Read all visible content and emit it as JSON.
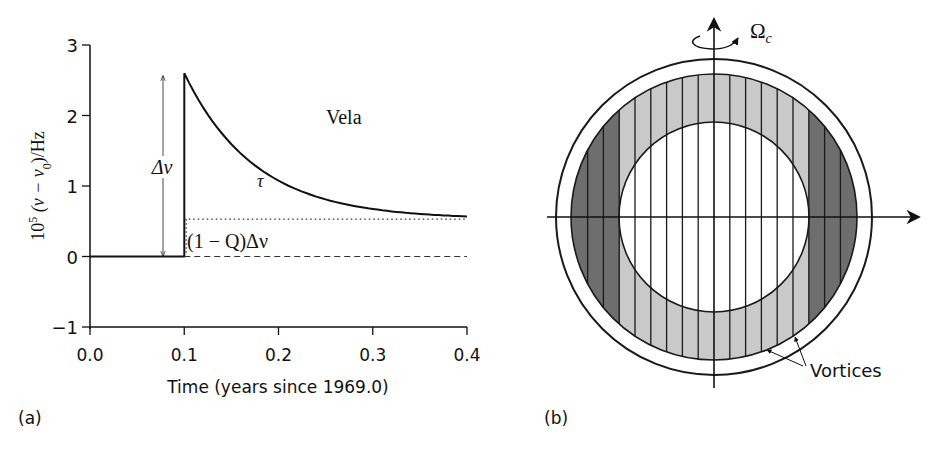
{
  "panel_a": {
    "label": "(a)",
    "annotation_vela": "Vela",
    "annotation_delta_nu": "Δν",
    "annotation_tau": "τ",
    "annotation_recovery": "(1 − Q)Δν"
  },
  "panel_b": {
    "label": "(b)",
    "omega_label": "Ω",
    "omega_subscript": "c",
    "vortices_label": "Vortices",
    "colors": {
      "dark_band": "#6e6e6e",
      "light_band": "#c9c9c9",
      "line": "#1a1a1a"
    }
  },
  "chart_data": [
    {
      "type": "line",
      "title": "Vela",
      "xlabel": "Time (years since 1969.0)",
      "ylabel": "10^5 (ν − ν₀)/Hz",
      "ylabel_parts": {
        "prefix": "10",
        "exp": "5",
        "body": " (ν − ν",
        "sub": "0",
        "suffix": ")/Hz"
      },
      "xlim": [
        0.0,
        0.4
      ],
      "ylim": [
        -1,
        3
      ],
      "xticks": [
        "0.0",
        "0.1",
        "0.2",
        "0.3",
        "0.4"
      ],
      "yticks": [
        "−1",
        "0",
        "1",
        "2",
        "3"
      ],
      "grid": false,
      "series": [
        {
          "name": "frequency residual (glitch + exponential recovery)",
          "style": "solid",
          "x": [
            0.0,
            0.1,
            0.1,
            0.12,
            0.14,
            0.16,
            0.18,
            0.2,
            0.22,
            0.25,
            0.28,
            0.31,
            0.34,
            0.37,
            0.4
          ],
          "y": [
            0.0,
            0.0,
            2.6,
            2.12,
            1.75,
            1.47,
            1.26,
            1.1,
            0.98,
            0.85,
            0.76,
            0.69,
            0.65,
            0.62,
            0.59
          ]
        },
        {
          "name": "permanent step level",
          "style": "dotted",
          "x": [
            0.1,
            0.4
          ],
          "y": [
            0.53,
            0.53
          ]
        },
        {
          "name": "pre-glitch baseline",
          "style": "dashed",
          "x": [
            0.1,
            0.4
          ],
          "y": [
            0.0,
            0.0
          ]
        }
      ],
      "annotations": [
        {
          "text": "Vela",
          "x": 0.26,
          "y": 2.0
        },
        {
          "text": "Δν",
          "x": 0.078,
          "y": 1.3,
          "note": "double arrow from 0 to 2.6"
        },
        {
          "text": "τ",
          "x": 0.18,
          "y": 1.0
        },
        {
          "text": "(1 − Q)Δν",
          "x": 0.11,
          "y": 0.22
        }
      ]
    }
  ]
}
